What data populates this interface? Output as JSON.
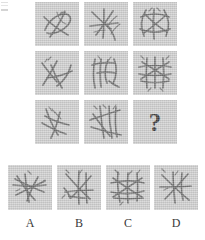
{
  "item": {
    "type": "matrix-reasoning",
    "title": "Progressive Matrix Item",
    "missing_cell_symbol": "?"
  },
  "colors": {
    "page_background": "#ffffff",
    "tile_background": "#cbcbcb",
    "stroke": "#5c5c5c",
    "question_mark": "#2b2b2b",
    "label_text": "#3a3a3a"
  },
  "matrix": {
    "rows": 3,
    "columns": 3,
    "cells": [
      {
        "id": "r1c1",
        "row": 1,
        "col": 1,
        "icon": "stick-figure-cluster-icon",
        "stick_count": 4,
        "description": "four crossing twigs forming a loose loop, open at right"
      },
      {
        "id": "r1c2",
        "row": 1,
        "col": 2,
        "icon": "stick-figure-cluster-icon",
        "stick_count": 5,
        "description": "five twigs radiating from a left-of-centre junction"
      },
      {
        "id": "r1c3",
        "row": 1,
        "col": 3,
        "icon": "stick-figure-cluster-icon",
        "stick_count": 6,
        "description": "six twigs forming a closed woven basket outline"
      },
      {
        "id": "r2c1",
        "row": 2,
        "col": 1,
        "icon": "stick-figure-cluster-icon",
        "stick_count": 4,
        "description": "four twigs, X crossing upper-left with a long sweeping arc"
      },
      {
        "id": "r2c2",
        "row": 2,
        "col": 2,
        "icon": "stick-figure-cluster-icon",
        "stick_count": 5,
        "description": "five mostly vertical twigs with curved hooks at top"
      },
      {
        "id": "r2c3",
        "row": 2,
        "col": 3,
        "icon": "stick-figure-cluster-icon",
        "stick_count": 7,
        "description": "dense woven lattice of seven twigs"
      },
      {
        "id": "r3c1",
        "row": 3,
        "col": 1,
        "icon": "stick-figure-cluster-icon",
        "stick_count": 4,
        "description": "four twigs, feathered crossing at upper area"
      },
      {
        "id": "r3c2",
        "row": 3,
        "col": 2,
        "icon": "stick-figure-cluster-icon",
        "stick_count": 6,
        "description": "six twigs, tall crossing verticals over a diagonal"
      },
      {
        "id": "r3c3",
        "row": 3,
        "col": 3,
        "icon": "question-mark-icon",
        "stick_count": 0,
        "is_missing": true,
        "label": "?",
        "description": "missing element to be chosen from the options"
      }
    ]
  },
  "options": {
    "count": 4,
    "items": [
      {
        "id": "A",
        "label": "A",
        "icon": "stick-figure-cluster-icon",
        "stick_count": 6,
        "description": "six twigs converging to a tight knot left of centre"
      },
      {
        "id": "B",
        "label": "B",
        "icon": "stick-figure-cluster-icon",
        "stick_count": 6,
        "description": "six twigs, long verticals with a branching fork lower-left"
      },
      {
        "id": "C",
        "label": "C",
        "icon": "stick-figure-cluster-icon",
        "stick_count": 8,
        "description": "eight twigs forming a dense overlapping web"
      },
      {
        "id": "D",
        "label": "D",
        "icon": "stick-figure-cluster-icon",
        "stick_count": 5,
        "description": "five twigs crossing in an open star arrangement"
      }
    ]
  }
}
